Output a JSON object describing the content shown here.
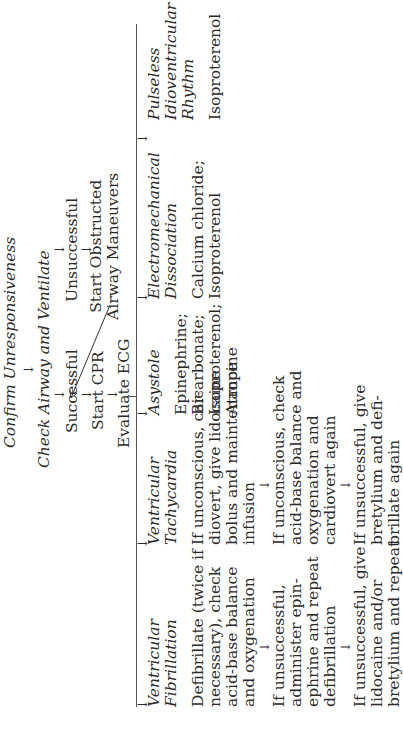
{
  "orientation": "rotated-90-ccw",
  "flow": {
    "confirm": {
      "prefix": "Confirm",
      "emph": "Unresponsiveness"
    },
    "check": {
      "text": "Check Airway and Ventilate"
    },
    "successful": "Successful",
    "start_cpr": "Start CPR",
    "evaluate_ecg": "Evaluate ECG",
    "unsuccessful": "Unsuccessful",
    "obstructed": [
      "Start Obstructed",
      "Airway Maneuvers"
    ],
    "arrow": "→",
    "down_arrow": "↓"
  },
  "columns": [
    {
      "title": [
        "Ventricular",
        "Fibrillation"
      ],
      "steps": [
        [
          "Defibrillate (twice if",
          "necessary), check",
          "acid-base balance",
          "and oxygenation"
        ],
        [
          "If unsuccessful,",
          "administer epin-",
          "ephrine and repeat",
          "defibrillation"
        ],
        [
          "If unsuccessful, give",
          "lidocaine and/or",
          "bretylium and repeat"
        ]
      ]
    },
    {
      "title": [
        "Ventricular",
        "Tachycardia"
      ],
      "steps": [
        [
          "If unconscious, car-",
          "diovert, give lidocaine",
          "bolus and maintenance",
          "infusion"
        ],
        [
          "If unconscious, check",
          "acid-base balance and",
          "oxygenation and",
          "cardiovert again"
        ],
        [
          "If unsuccessful, give",
          "bretylium and defi-",
          "brillate again"
        ]
      ]
    },
    {
      "title": [
        "Asystole"
      ],
      "steps": [
        [
          "Epinephrine;",
          "Bicarbonate;",
          "Isoproterenol;",
          "Atropine"
        ]
      ]
    },
    {
      "title": [
        "Electromechanical",
        "Dissociation"
      ],
      "steps": [
        [
          "Calcium chloride;",
          "Isoproterenol"
        ]
      ]
    },
    {
      "title": [
        "Pulseless",
        "Idioventricular",
        "Rhythm"
      ],
      "steps": [
        [
          "Isoproterenol"
        ]
      ]
    }
  ]
}
